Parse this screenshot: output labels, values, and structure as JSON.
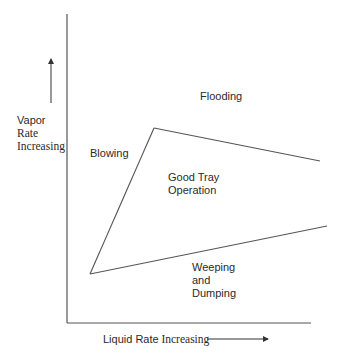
{
  "diagram": {
    "colors": {
      "line": "#555555",
      "text": "#2a2a2a",
      "background": "#ffffff"
    },
    "axes": {
      "y_label": {
        "line1": "Vapor",
        "line2": "Rate",
        "line3": "Increasing"
      },
      "x_label": {
        "part1": "Liquid Rate",
        "part2": "Increasing"
      }
    },
    "regions": {
      "flooding": "Flooding",
      "blowing": "Blowing",
      "good_tray": {
        "line1": "Good Tray",
        "line2": "Operation"
      },
      "weeping": {
        "line1": "Weeping",
        "line2": "and",
        "line3": "Dumping"
      }
    }
  }
}
